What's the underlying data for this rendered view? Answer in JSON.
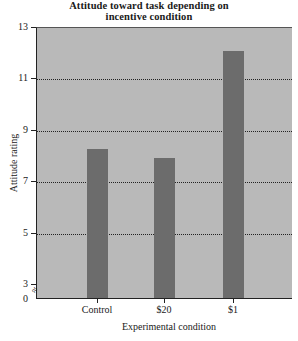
{
  "chart_data": {
    "type": "bar",
    "title": "Attitude toward task depending on incentive condition",
    "title_lines": [
      "Attitude toward task depending on",
      "incentive condition"
    ],
    "xlabel": "Experimental condition",
    "ylabel": "Attitude rating",
    "categories": [
      "Control",
      "$20",
      "$1"
    ],
    "values": [
      8.25,
      7.9,
      12.05
    ],
    "ylim": [
      0,
      13
    ],
    "y_axis_break": "between 0 and 3",
    "yticks": [
      0,
      3,
      5,
      7,
      9,
      11,
      13
    ],
    "grid": "horizontal dotted lines at 5, 7, 9, 11",
    "legend": null,
    "colors": {
      "plot_background": "#b9b9b9",
      "bars": "#6c6c6c"
    }
  }
}
